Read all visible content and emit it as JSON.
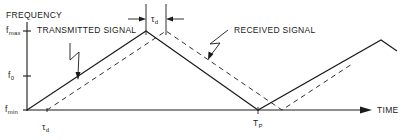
{
  "diagram": {
    "y_axis_label": "FREQUENCY",
    "x_axis_label": "TIME",
    "y_ticks": [
      {
        "main": "f",
        "sub": "max"
      },
      {
        "main": "f",
        "sub": "0"
      },
      {
        "main": "f",
        "sub": "min"
      }
    ],
    "x_ticks": [
      {
        "main": "τ",
        "sub": "d"
      },
      {
        "main": "T",
        "sub": "P"
      }
    ],
    "delay_marker": {
      "main": "τ",
      "sub": "d"
    },
    "callouts": {
      "transmitted": "TRANSMITTED SIGNAL",
      "received": "RECEIVED SIGNAL"
    },
    "series": [
      {
        "name": "Transmitted signal",
        "style": "solid",
        "shape": "triangular FM sweep f_min→f_max→f_min"
      },
      {
        "name": "Received signal",
        "style": "dashed",
        "shape": "same sweep delayed by τd"
      }
    ],
    "colors": {
      "ink": "#1a1a1a",
      "background": "#ffffff"
    }
  }
}
